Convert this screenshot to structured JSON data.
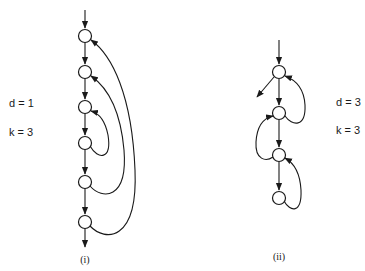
{
  "diagrams": [
    {
      "id": "i",
      "caption": "(i)",
      "params": {
        "d": "d = 1",
        "k": "k = 3"
      },
      "nodes": [
        "n1",
        "n2",
        "n3",
        "n4",
        "n5",
        "n6"
      ],
      "entry": "n1",
      "exit": "n6",
      "forward_edges": [
        [
          "n1",
          "n2"
        ],
        [
          "n2",
          "n3"
        ],
        [
          "n3",
          "n4"
        ],
        [
          "n4",
          "n5"
        ],
        [
          "n5",
          "n6"
        ]
      ],
      "back_edges": [
        [
          "n4",
          "n3"
        ],
        [
          "n5",
          "n2"
        ],
        [
          "n6",
          "n1"
        ]
      ]
    },
    {
      "id": "ii",
      "caption": "(ii)",
      "params": {
        "d": "d = 3",
        "k": "k = 3"
      },
      "nodes": [
        "n1",
        "n2",
        "n3",
        "n4"
      ],
      "entry": "n1",
      "exit": "n1",
      "forward_edges": [
        [
          "n1",
          "n2"
        ],
        [
          "n2",
          "n3"
        ],
        [
          "n3",
          "n4"
        ]
      ],
      "back_edges": [
        [
          "n2",
          "n1"
        ],
        [
          "n3",
          "n2"
        ],
        [
          "n4",
          "n3"
        ]
      ]
    }
  ]
}
